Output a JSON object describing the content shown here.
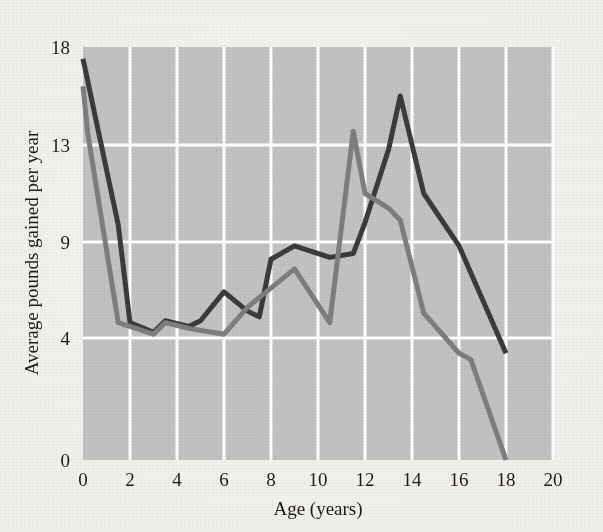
{
  "chart_data": {
    "type": "line",
    "title": "",
    "xlabel": "Age (years)",
    "ylabel": "Average pounds gained per year",
    "xlim": [
      0,
      20
    ],
    "ylim": [
      0,
      18
    ],
    "xticks": [
      0,
      2,
      4,
      6,
      8,
      10,
      12,
      14,
      16,
      18,
      20
    ],
    "xtick_labels": [
      "0",
      "2",
      "4",
      "6",
      "8",
      "10",
      "12",
      "14",
      "16",
      "18",
      "20"
    ],
    "yticks": [
      0,
      4,
      9,
      13,
      18
    ],
    "ytick_labels": [
      "0",
      "4",
      "9",
      "13",
      "18"
    ],
    "grid": true,
    "grid_color": "#ffffff",
    "plot_bg": "#c3c2c1",
    "legend": "none",
    "series": [
      {
        "name": "boys",
        "color": "#3c3b3b",
        "points": [
          [
            0.0,
            17.4
          ],
          [
            1.5,
            9.7
          ],
          [
            2.0,
            4.8
          ],
          [
            3.0,
            4.3
          ],
          [
            3.5,
            4.9
          ],
          [
            4.5,
            4.6
          ],
          [
            5.0,
            4.9
          ],
          [
            6.0,
            6.4
          ],
          [
            7.0,
            5.4
          ],
          [
            7.5,
            5.1
          ],
          [
            8.0,
            8.1
          ],
          [
            9.0,
            8.8
          ],
          [
            10.5,
            8.2
          ],
          [
            11.5,
            8.4
          ],
          [
            12.0,
            9.8
          ],
          [
            13.0,
            12.8
          ],
          [
            13.5,
            15.5
          ],
          [
            14.5,
            11.0
          ],
          [
            16.0,
            8.8
          ],
          [
            18.0,
            3.5
          ]
        ]
      },
      {
        "name": "girls",
        "color": "#7f7e7e",
        "points": [
          [
            0.0,
            16.0
          ],
          [
            0.2,
            13.6
          ],
          [
            1.5,
            4.8
          ],
          [
            3.0,
            4.2
          ],
          [
            3.5,
            4.8
          ],
          [
            4.5,
            4.5
          ],
          [
            6.0,
            4.2
          ],
          [
            7.0,
            5.6
          ],
          [
            7.5,
            6.1
          ],
          [
            9.0,
            7.6
          ],
          [
            10.5,
            4.8
          ],
          [
            11.5,
            13.7
          ],
          [
            12.0,
            11.0
          ],
          [
            13.0,
            10.4
          ],
          [
            13.5,
            9.9
          ],
          [
            14.5,
            5.3
          ],
          [
            16.0,
            3.5
          ],
          [
            16.5,
            3.3
          ],
          [
            18.0,
            0.0
          ]
        ]
      }
    ]
  },
  "axes": {
    "xlabel": "Age (years)",
    "ylabel": "Average pounds gained per year"
  }
}
